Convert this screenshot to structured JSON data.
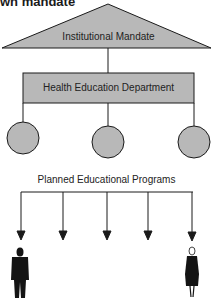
{
  "title": "wn mandate",
  "diagram": {
    "apex_label": "Institutional Mandate",
    "department_label": "Health Education Department",
    "unit_count": 3,
    "programs_label": "Planned Educational Programs",
    "arrow_count": 5,
    "audience": [
      "man-figure",
      "woman-figure"
    ]
  },
  "colors": {
    "fill": "#b8b8b8",
    "stroke": "#1a1a1a",
    "figure": "#141414"
  }
}
